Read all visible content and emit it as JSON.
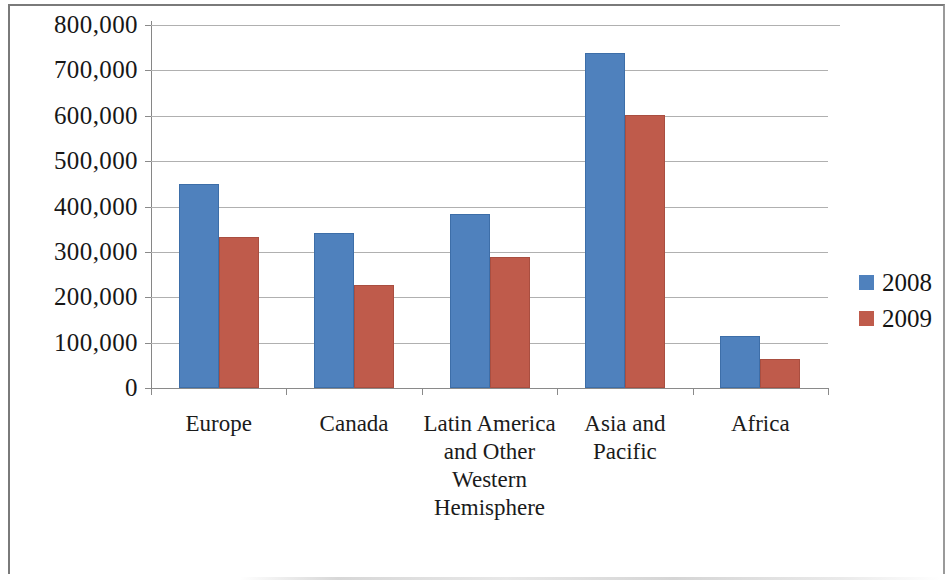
{
  "chart_data": {
    "type": "bar",
    "title": "",
    "subtitle": "",
    "xlabel": "",
    "ylabel": "",
    "categories": [
      "Europe",
      "Canada",
      "Latin America and Other Western Hemisphere",
      "Asia and Pacific",
      "Africa"
    ],
    "series": [
      {
        "name": "2008",
        "color": "#4f81bd",
        "values": [
          450000,
          341000,
          383000,
          738000,
          115000
        ]
      },
      {
        "name": "2009",
        "color": "#bf5b4b",
        "values": [
          333000,
          228000,
          289000,
          601000,
          65000
        ]
      }
    ],
    "ylim": [
      0,
      800000
    ],
    "ytick_values": [
      800000,
      700000,
      600000,
      500000,
      400000,
      300000,
      200000,
      100000,
      0
    ],
    "ytick_labels": [
      "800,000",
      "700,000",
      "600,000",
      "500,000",
      "400,000",
      "300,000",
      "200,000",
      "100,000",
      "0"
    ],
    "grid": true,
    "legend_position": "right"
  },
  "legend": {
    "entries": [
      {
        "label": "2008",
        "color": "#4f81bd"
      },
      {
        "label": "2009",
        "color": "#bf5b4b"
      }
    ]
  }
}
